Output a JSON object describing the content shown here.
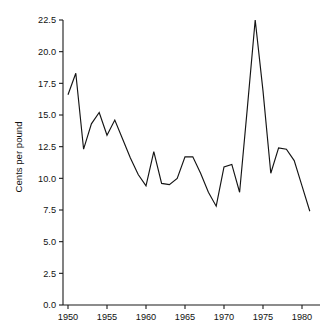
{
  "chart": {
    "title": "",
    "ylabel": "Cents per pound",
    "xlabel": "",
    "background_color": "#ffffff",
    "line_color": "#141414",
    "axis_color": "#1a1a1a"
  },
  "chart_data": {
    "type": "line",
    "title": "",
    "xlabel": "",
    "ylabel": "Cents per pound",
    "xlim": [
      1949.4,
      1981.6
    ],
    "ylim": [
      0.0,
      22.5
    ],
    "grid": false,
    "legend": false,
    "xticks": [
      1950,
      1955,
      1960,
      1965,
      1970,
      1975,
      1980
    ],
    "xtick_labels": [
      "1950",
      "1955",
      "1960",
      "1965",
      "1970",
      "1975",
      "1980"
    ],
    "yticks": [
      0.0,
      2.5,
      5.0,
      7.5,
      10.0,
      12.5,
      15.0,
      17.5,
      20.0,
      22.5
    ],
    "ytick_labels": [
      "0.0",
      "2.5",
      "5.0",
      "7.5",
      "10.0",
      "12.5",
      "15.0",
      "17.5",
      "20.0",
      "22.5"
    ],
    "x": [
      1950,
      1951,
      1952,
      1953,
      1954,
      1955,
      1956,
      1957,
      1958,
      1959,
      1960,
      1961,
      1962,
      1963,
      1964,
      1965,
      1966,
      1967,
      1968,
      1969,
      1970,
      1971,
      1972,
      1973,
      1974,
      1975,
      1976,
      1977,
      1978,
      1979,
      1980,
      1981
    ],
    "values": [
      16.6,
      18.3,
      12.3,
      14.3,
      15.2,
      13.4,
      14.6,
      13.1,
      11.6,
      10.3,
      9.4,
      12.1,
      9.6,
      9.5,
      10.0,
      11.7,
      11.7,
      10.4,
      8.9,
      7.8,
      10.9,
      11.1,
      8.9,
      15.6,
      22.5,
      16.9,
      10.4,
      12.4,
      12.3,
      11.4,
      9.4,
      7.4
    ],
    "series": [
      {
        "name": "Cents per pound",
        "values": [
          16.6,
          18.3,
          12.3,
          14.3,
          15.2,
          13.4,
          14.6,
          13.1,
          11.6,
          10.3,
          9.4,
          12.1,
          9.6,
          9.5,
          10.0,
          11.7,
          11.7,
          10.4,
          8.9,
          7.8,
          10.9,
          11.1,
          8.9,
          15.6,
          22.5,
          16.9,
          10.4,
          12.4,
          12.3,
          11.4,
          9.4,
          7.4
        ]
      }
    ]
  }
}
